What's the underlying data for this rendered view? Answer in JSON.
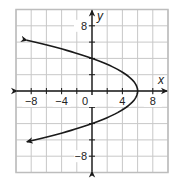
{
  "chart_data": {
    "type": "line",
    "title": "",
    "xlabel": "x",
    "ylabel": "y",
    "xlim": [
      -10,
      10
    ],
    "ylim": [
      -10,
      10
    ],
    "grid": true,
    "grid_step": 2,
    "x_ticks": [
      -8,
      -4,
      0,
      4,
      8
    ],
    "x_tick_labels": [
      "−8",
      "−4",
      "0",
      "4",
      "8"
    ],
    "y_ticks": [
      8,
      -8
    ],
    "y_tick_labels": [
      "8",
      "−8"
    ],
    "series": [
      {
        "name": "parabola",
        "equation": "x = 6 - (3/8)y^2",
        "vertex": [
          6,
          0
        ],
        "opens": "left",
        "points": [
          {
            "x": -10,
            "y": 6.5
          },
          {
            "x": -4,
            "y": 5.2
          },
          {
            "x": 0,
            "y": 4
          },
          {
            "x": 4,
            "y": 2.3
          },
          {
            "x": 6,
            "y": 0
          },
          {
            "x": 4,
            "y": -2.3
          },
          {
            "x": 0,
            "y": -4
          },
          {
            "x": -4,
            "y": -5.2
          },
          {
            "x": -10,
            "y": -6.5
          }
        ],
        "arrows_at_ends": true,
        "color": "#1a1a1a"
      }
    ],
    "legend": null
  },
  "colors": {
    "grid": "#c8c8c8",
    "axis": "#1a1a1a",
    "curve": "#1a1a1a",
    "border": "#bdbdbd"
  }
}
